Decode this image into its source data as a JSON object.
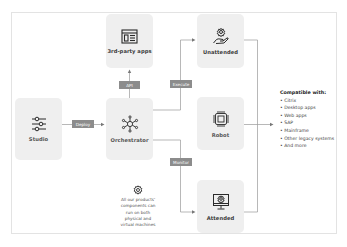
{
  "nodes": {
    "third_party": {
      "label": "3rd-party apps",
      "icon": "browser-window-icon"
    },
    "studio": {
      "label": "Studio",
      "icon": "sliders-icon"
    },
    "orchestrator": {
      "label": "Orchestrator",
      "icon": "network-hub-icon"
    },
    "unattended": {
      "label": "Unattended",
      "icon": "hand-gear-icon"
    },
    "robot": {
      "label": "Robot",
      "icon": "chip-icon"
    },
    "attended": {
      "label": "Attended",
      "icon": "monitor-gear-icon"
    }
  },
  "edges": {
    "api": "API",
    "deploy": "Deploy",
    "execute": "Execute",
    "monitor": "Monitor"
  },
  "compatible": {
    "title": "Compatible with:",
    "items": [
      "• Citrix",
      "• Desktop apps",
      "• Web apps",
      "• SAP",
      "• Mainframe",
      "• Other legacy systems",
      "• And more"
    ]
  },
  "note": {
    "icon": "gear-icon",
    "lines": [
      "All our products'",
      "components can",
      "run on both",
      "physical and",
      "virtual machines"
    ]
  },
  "colors": {
    "box_bg": "#efefef",
    "tag_bg": "#8c8c8c",
    "line": "#9a9a9a",
    "icon": "#2b2b2b"
  }
}
